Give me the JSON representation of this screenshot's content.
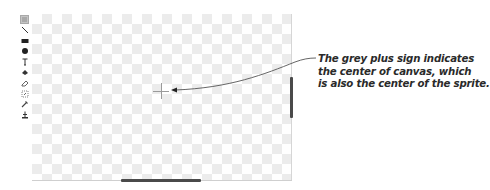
{
  "toolbar": {
    "tools": [
      {
        "name": "select-tool",
        "icon": "select-icon",
        "active": true
      },
      {
        "name": "line-tool",
        "icon": "line-icon",
        "active": false
      },
      {
        "name": "rectangle-tool",
        "icon": "rectangle-icon",
        "active": false
      },
      {
        "name": "ellipse-tool",
        "icon": "ellipse-icon",
        "active": false
      },
      {
        "name": "text-tool",
        "icon": "text-icon",
        "active": false
      },
      {
        "name": "fill-tool",
        "icon": "fill-bucket-icon",
        "active": false
      },
      {
        "name": "eraser-tool",
        "icon": "eraser-icon",
        "active": false
      },
      {
        "name": "rotate-select-tool",
        "icon": "rotate-select-icon",
        "active": false
      },
      {
        "name": "eyedropper-tool",
        "icon": "eyedropper-icon",
        "active": false
      },
      {
        "name": "set-center-tool",
        "icon": "set-center-icon",
        "active": false
      }
    ]
  },
  "canvas": {
    "center_marker": "plus-sign",
    "center_marker_color": "#9a9a9a"
  },
  "annotation": {
    "lines": [
      "The grey plus sign indicates",
      "the center of canvas, which",
      "is also the center of the sprite."
    ]
  }
}
